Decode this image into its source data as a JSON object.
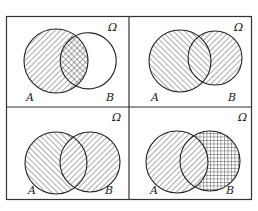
{
  "figure": {
    "universe_label": "Ω",
    "panels": [
      {
        "id": "panel-1",
        "set_a_label": "A",
        "set_b_label": "B",
        "shading": "A fully hatched (/), intersection cross-hatched, B outline only (partially drawn)"
      },
      {
        "id": "panel-2",
        "set_a_label": "A",
        "set_b_label": "B",
        "shading": "A hatched (\\), B minus A hatched (/)"
      },
      {
        "id": "panel-3",
        "set_a_label": "A",
        "set_b_label": "B",
        "shading": "A minus B hatched (\\), B hatched (/)"
      },
      {
        "id": "panel-4",
        "set_a_label": "A",
        "set_b_label": "B",
        "shading": "A hatched (/), B grid-hatched, intersection lighter"
      }
    ]
  }
}
